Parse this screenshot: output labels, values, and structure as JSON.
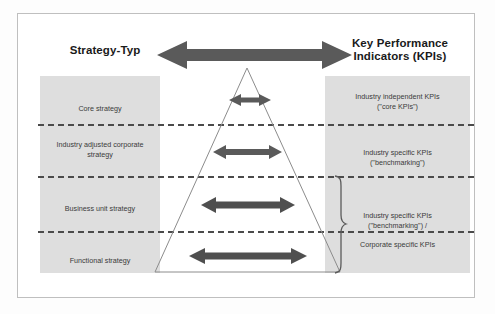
{
  "diagram": {
    "title_left": "Strategy-Typ",
    "title_right_line1": "Key Performance",
    "title_right_line2": "Indicators (KPIs)",
    "levels": [
      {
        "strategy": "Core strategy",
        "kpi_line1": "Industry independent KPIs",
        "kpi_line2": "(\"core KPIs\")"
      },
      {
        "strategy_line1": "Industry adjusted corporate",
        "strategy_line2": "strategy",
        "kpi_line1": "Industry specific KPIs",
        "kpi_line2": "(\"benchmarking\")"
      },
      {
        "strategy": "Business unit  strategy"
      },
      {
        "strategy": "Functional strategy"
      }
    ],
    "grouped_kpi": {
      "line1": "Industry specific KPIs",
      "line2": "(\"benchmarking\") /",
      "line3": "Corporate specific KPIs"
    },
    "icons": {
      "top_arrow": "double-headed-arrow",
      "level_arrow": "double-headed-arrow",
      "brace": "curly-brace-right",
      "pyramid": "triangle-outline"
    },
    "colors": {
      "panel_fill": "#dedede",
      "arrow_fill": "#5a5a5a",
      "divider": "#4a4a4a",
      "frame": "#bfbfbf",
      "triangle_stroke": "#8c8c8c"
    }
  }
}
